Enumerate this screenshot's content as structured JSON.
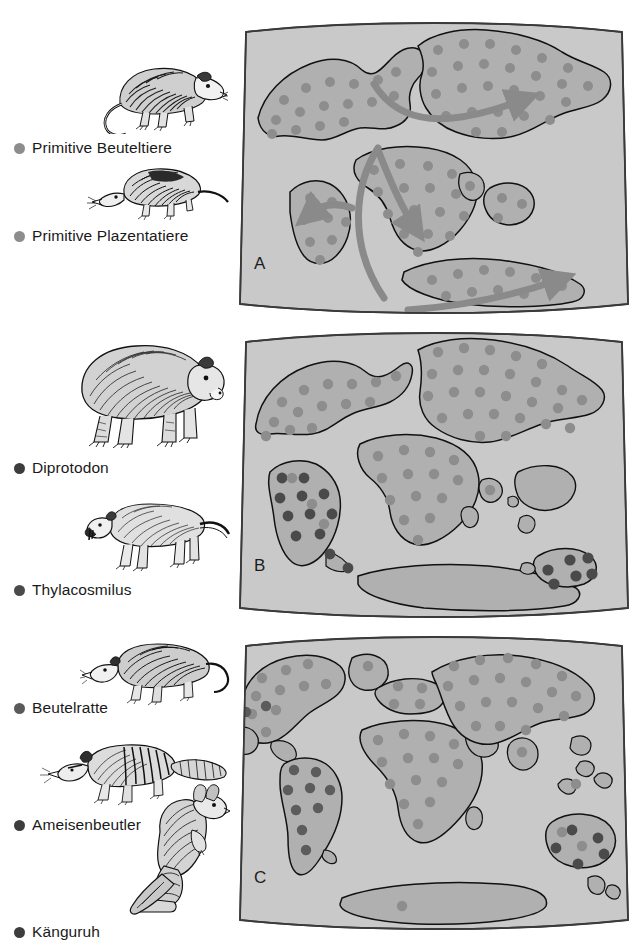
{
  "figure": {
    "background_color": "#ffffff"
  },
  "colors": {
    "ocean": "#c9c9c9",
    "land": "#b0b0b0",
    "land_outline": "#1a1a1a",
    "panel_border": "#3a3a3a",
    "dot_light": "#8d8d8d",
    "dot_dark": "#4a4a4a",
    "arrow": "#8a8a8a",
    "text": "#1a1a1a",
    "ink": "#111111"
  },
  "legend": {
    "groups": [
      {
        "panel": "A",
        "items": [
          {
            "label": "Primitive Beuteltiere",
            "bullet_color": "#8d8d8d",
            "bullet_name": "legend-bullet-light",
            "animal_name": "opossum-illustration"
          },
          {
            "label": "Primitive Plazentatiere",
            "bullet_color": "#8d8d8d",
            "bullet_name": "legend-bullet-light",
            "animal_name": "shrew-illustration"
          }
        ]
      },
      {
        "panel": "B",
        "items": [
          {
            "label": "Diprotodon",
            "bullet_color": "#3d3d3d",
            "bullet_name": "legend-bullet-dark",
            "animal_name": "diprotodon-illustration"
          },
          {
            "label": "Thylacosmilus",
            "bullet_color": "#4a4a4a",
            "bullet_name": "legend-bullet-dark",
            "animal_name": "thylacosmilus-illustration"
          }
        ]
      },
      {
        "panel": "C",
        "items": [
          {
            "label": "Beutelratte",
            "bullet_color": "#5a5a5a",
            "bullet_name": "legend-bullet-medium",
            "animal_name": "opossum-c-illustration"
          },
          {
            "label": "Ameisenbeutler",
            "bullet_color": "#3d3d3d",
            "bullet_name": "legend-bullet-dark",
            "animal_name": "numbat-illustration"
          },
          {
            "label": "Känguruh",
            "bullet_color": "#3d3d3d",
            "bullet_name": "legend-bullet-dark",
            "animal_name": "kangaroo-illustration"
          }
        ]
      }
    ]
  },
  "panels": [
    {
      "letter": "A",
      "caption": "Pangaea — Urkontinent mit Wanderungsrouten",
      "stage": "supercontinent",
      "has_arrows": true,
      "arrow_count": 4,
      "dot_scheme": "uniform-light"
    },
    {
      "letter": "B",
      "caption": "Auseinanderbrechende Kontinente",
      "stage": "breakup",
      "has_arrows": false,
      "arrow_count": 0,
      "dot_scheme": "mixed-isolated-marsupials"
    },
    {
      "letter": "C",
      "caption": "Heutige Kontinente",
      "stage": "modern",
      "has_arrows": false,
      "arrow_count": 0,
      "dot_scheme": "modern-distribution"
    }
  ]
}
